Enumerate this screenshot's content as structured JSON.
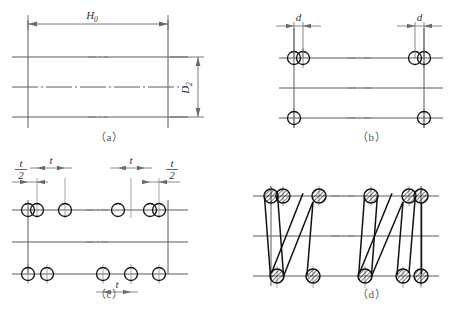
{
  "figure": {
    "panel_count": 4,
    "captions": {
      "a": "（a）",
      "b": "（b）",
      "c": "（c）",
      "d": "（d）"
    }
  },
  "symbols": {
    "free_height": "H",
    "free_height_sub": "0",
    "mean_diameter": "D",
    "mean_diameter_sub": "2",
    "wire_diameter": "d",
    "pitch": "t",
    "half_pitch_numerator": "t",
    "half_pitch_denominator": "2"
  },
  "panels": {
    "a": {
      "name": "outline-step",
      "labels": [
        "H",
        "0",
        "D",
        "2"
      ],
      "horizontal_lines": 3,
      "vertical_lines": 2,
      "dimension_h0": "H",
      "dimension_h0_sub": "0",
      "dimension_d2": "D",
      "dimension_d2_sub": "2"
    },
    "b": {
      "name": "wire-circles-step",
      "label_left": "d",
      "label_right": "d",
      "circles_top": 4,
      "circles_bottom": 2
    },
    "c": {
      "name": "pitch-spacing-step",
      "label_t_left": "t",
      "label_t_right": "t",
      "label_t_bottom": "t",
      "label_half_num_left": "t",
      "label_half_den_left": "2",
      "label_half_num_right": "t",
      "label_half_den_right": "2",
      "circles_top": 6,
      "circles_bottom": 5
    },
    "d": {
      "name": "finished-spring-step",
      "hatched_circles_top": 5,
      "hatched_circles_bottom": 5,
      "coils": 4
    }
  },
  "colors": {
    "line": "#4a4a4a",
    "heavy_line": "#111111",
    "center_line": "#6a6a6a",
    "caption": "#555555",
    "background": "#ffffff"
  }
}
